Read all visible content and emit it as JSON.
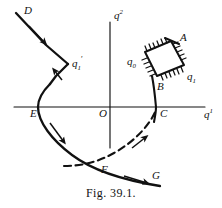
{
  "figure": {
    "caption": "Fig. 39.1.",
    "axes": {
      "vertical_label_base": "q",
      "vertical_label_sup": "2",
      "horizontal_label_base": "q",
      "horizontal_label_sup": "1",
      "origin_label": "O",
      "axis_color": "#111111"
    },
    "points": {
      "D": "D",
      "E": "E",
      "F": "F",
      "G": "G",
      "A": "A",
      "B": "B",
      "C": "C"
    },
    "q_labels": {
      "q0": {
        "base": "q",
        "sub": "0"
      },
      "q1": {
        "base": "q",
        "sub": "1"
      },
      "q1_prime": {
        "base": "q",
        "sub": "1",
        "prime": "′"
      }
    },
    "curves": {
      "solid_label": "solid trajectory D-q1'-E-F-G",
      "dashed_label": "dashed trajectory F-C",
      "curve_color": "#111111",
      "hatch_color": "#111111"
    },
    "region": {
      "name": "hatched quadrilateral q0-A-q1-B",
      "vertices": [
        "q0",
        "A",
        "q1",
        "B"
      ]
    }
  }
}
